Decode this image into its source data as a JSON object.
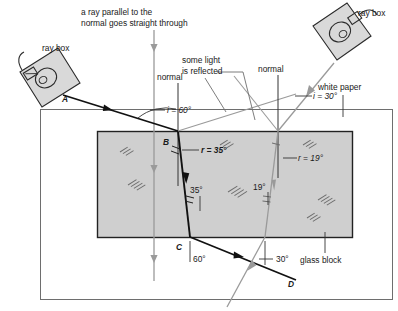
{
  "diagram": {
    "colors": {
      "ray_black": "#111111",
      "ray_gray": "#9a9a9a",
      "glass_fill": "#cfcfcf",
      "glass_stroke": "#222222",
      "paper_stroke": "#6e6e6e",
      "box_fill": "#d9d9d9",
      "text": "#1a1a1a"
    },
    "annotations": {
      "parallel_note_line1": "a ray parallel to the",
      "parallel_note_line2": "normal goes straight through",
      "ray_box_left": "ray box",
      "ray_box_right": "ray box",
      "some_light_line1": "some light",
      "some_light_line2": "is reflected",
      "normal_left": "normal",
      "normal_right": "normal",
      "white_paper": "white paper",
      "glass_block": "glass block"
    },
    "points": {
      "a": "A",
      "b": "B",
      "c": "C",
      "d": "D"
    },
    "angles": {
      "incidence_left": "i = 60°",
      "refraction_left": "r = 35°",
      "internal_left": "35°",
      "exit_left": "60°",
      "incidence_right": "i = 30°",
      "refraction_right": "r = 19°",
      "internal_right": "19°",
      "exit_right": "30°"
    },
    "values": {
      "i_left_deg": 60,
      "r_left_deg": 35,
      "i_right_deg": 30,
      "r_right_deg": 19
    }
  }
}
